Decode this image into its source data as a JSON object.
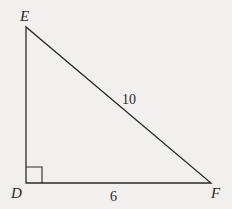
{
  "diagram": {
    "type": "right-triangle",
    "colors": {
      "background": "#f1f0ee",
      "stroke": "#2a2a2a"
    },
    "vertices": {
      "E": {
        "label": "E"
      },
      "D": {
        "label": "D",
        "right_angle": true
      },
      "F": {
        "label": "F"
      }
    },
    "sides": {
      "EF": {
        "label": "10"
      },
      "DF": {
        "label": "6"
      }
    }
  }
}
